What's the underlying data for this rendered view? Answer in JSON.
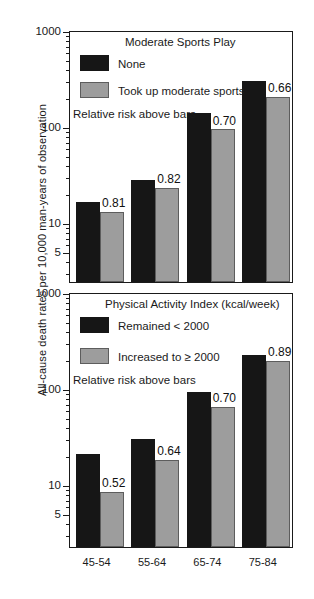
{
  "chart_data": [
    {
      "type": "bar",
      "panel": "top",
      "title": "Moderate Sports Play",
      "note": "Relative risk above bars",
      "xlabel": "",
      "ylabel": "All-cause death rates per 10,000 man-years of observation",
      "yscale": "log",
      "ylim": [
        3,
        1000
      ],
      "yticks": [
        1000,
        100,
        10,
        5
      ],
      "ytick_labels": [
        "1000",
        "100",
        "10",
        "5"
      ],
      "grid": false,
      "legend_position": "top-center",
      "categories": [
        "45-54",
        "55-64",
        "65-74",
        "75-84"
      ],
      "series": [
        {
          "name": "None",
          "color": "#161616",
          "values": [
            17,
            29,
            147,
            310
          ]
        },
        {
          "name": "Took up moderate sports",
          "color": "#9d9d9d",
          "values": [
            13.5,
            24,
            98,
            216
          ]
        }
      ],
      "annotations": [
        "0.81",
        "0.82",
        "0.70",
        "0.66"
      ],
      "annotation_label": "Relative risk above bars"
    },
    {
      "type": "bar",
      "panel": "bottom",
      "title": "Physical Activity Index (kcal/week)",
      "note": "Relative risk above bars",
      "xlabel": "",
      "ylabel": "All-cause death rates per 10,000 man-years of observation",
      "yscale": "log",
      "ylim": [
        3,
        1000
      ],
      "yticks": [
        1000,
        100,
        10,
        5
      ],
      "ytick_labels": [
        "1000",
        "100",
        "10",
        "5"
      ],
      "grid": false,
      "legend_position": "top-center",
      "categories": [
        "45-54",
        "55-64",
        "65-74",
        "75-84"
      ],
      "series": [
        {
          "name": "Remained < 2000",
          "color": "#161616",
          "values": [
            22,
            31,
            96,
            235
          ]
        },
        {
          "name": "Increased to ≥ 2000",
          "color": "#9d9d9d",
          "values": [
            8.8,
            19,
            68,
            205
          ]
        }
      ],
      "annotations": [
        "0.52",
        "0.64",
        "0.70",
        "0.89"
      ],
      "annotation_label": "Relative risk above bars"
    }
  ],
  "axis": {
    "ylabel": "All-cause death rates per 10,000 man-years of observation",
    "ytick_labels": [
      "1000",
      "100",
      "10",
      "5"
    ],
    "category_labels": [
      "45-54",
      "55-64",
      "65-74",
      "75-84"
    ]
  },
  "top_panel": {
    "legend_title": "Moderate Sports Play",
    "series_1_label": "None",
    "series_2_label": "Took up moderate sports",
    "note": "Relative risk above bars",
    "rr": [
      "0.81",
      "0.82",
      "0.70",
      "0.66"
    ]
  },
  "bottom_panel": {
    "legend_title": "Physical Activity Index (kcal/week)",
    "series_1_label": "Remained < 2000",
    "series_2_label": "Increased to ≥ 2000",
    "note": "Relative risk above bars",
    "rr": [
      "0.52",
      "0.64",
      "0.70",
      "0.89"
    ]
  }
}
